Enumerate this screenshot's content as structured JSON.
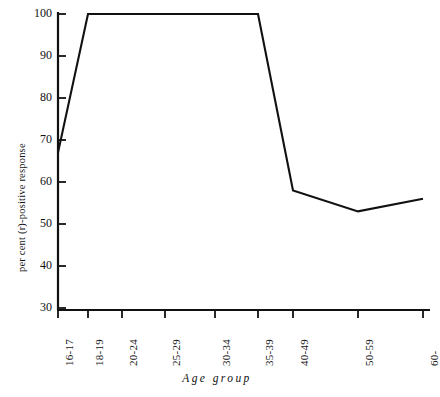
{
  "chart_data": {
    "type": "line",
    "title": "",
    "xlabel": "Age group",
    "ylabel": "per cent (r)-positive response",
    "categories": [
      "16-17",
      "18-19",
      "20-24",
      "25-29",
      "30-34",
      "35-39",
      "40-49",
      "50-59",
      "60-"
    ],
    "values": [
      67,
      100,
      100,
      100,
      100,
      100,
      58,
      53,
      56
    ],
    "ylim": [
      30,
      100
    ],
    "yticks": [
      30,
      40,
      50,
      60,
      70,
      80,
      90,
      100
    ],
    "ytick_labels": [
      "30",
      "40",
      "50",
      "60",
      "70",
      "80",
      "90",
      "100"
    ],
    "grid": false,
    "legend": "none",
    "series": [
      {
        "name": "per cent (r)-positive response",
        "values": [
          67,
          100,
          100,
          100,
          100,
          100,
          58,
          53,
          56
        ]
      }
    ],
    "line_color": "#111111",
    "axis_color": "#111111"
  }
}
